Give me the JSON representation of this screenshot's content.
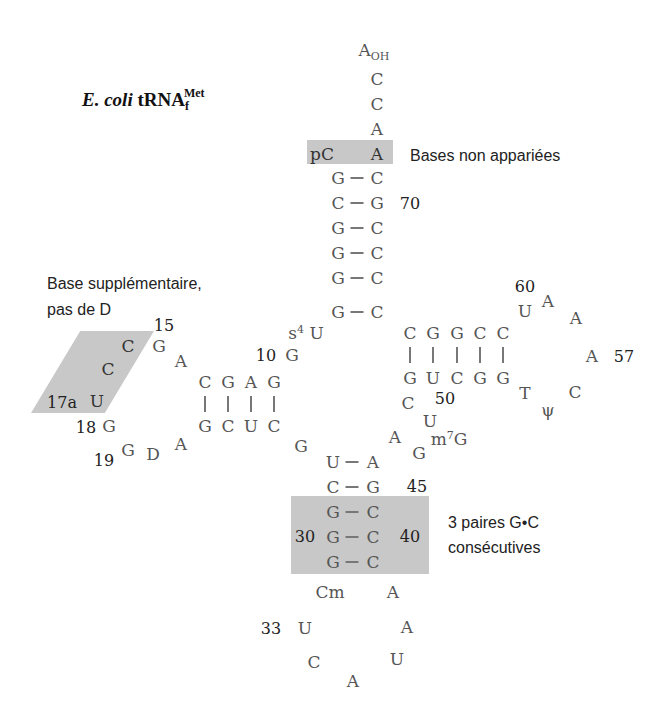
{
  "title": {
    "organism": "E. coli",
    "molecule": "tRNA",
    "subscript": "f",
    "superscript": "Met"
  },
  "annotations": {
    "unpaired": "Bases non appariées",
    "extra_base_line1": "Base supplémentaire,",
    "extra_base_line2": "pas de D",
    "gc_pairs_line1": "3 paires G•C",
    "gc_pairs_line2": "consécutives"
  },
  "acceptor": {
    "tail": [
      "A",
      "C",
      "C",
      "A"
    ],
    "tail_oh": "OH",
    "unpaired_left": "pC",
    "unpaired_right": "A",
    "pairs": [
      [
        "G",
        "C"
      ],
      [
        "C",
        "G"
      ],
      [
        "G",
        "C"
      ],
      [
        "G",
        "C"
      ],
      [
        "G",
        "C"
      ],
      [
        "G",
        "C"
      ]
    ],
    "num_70": "70"
  },
  "d_arm": {
    "s4u_s": "s",
    "s4u_sup": "4",
    "s4u_u": "U",
    "num_10": "10",
    "g10": "G",
    "top": [
      "C",
      "G",
      "A",
      "G"
    ],
    "bottom": [
      "G",
      "C",
      "U",
      "C"
    ],
    "loop": {
      "A14": "A",
      "G15": "G",
      "num_15": "15",
      "C16": "C",
      "C17": "C",
      "U17a": "U",
      "num_17a": "17a",
      "G18": "G",
      "num_18": "18",
      "G19": "G",
      "num_19": "19",
      "D20": "D",
      "A21": "A"
    },
    "g26": "G"
  },
  "t_arm": {
    "top": [
      "C",
      "G",
      "G",
      "C",
      "C"
    ],
    "bottom": [
      "G",
      "U",
      "C",
      "G",
      "G"
    ],
    "loop": {
      "U60": "U",
      "num_60": "60",
      "A59": "A",
      "A58": "A",
      "A57": "A",
      "num_57": "57",
      "C56": "C",
      "psi55": "ψ",
      "T54": "T"
    }
  },
  "variable_loop": {
    "C48": "C",
    "U47": "U",
    "num_50": "50",
    "m7G_m": "m",
    "m7G_sup": "7",
    "m7G_g": "G",
    "G45b": "G",
    "A44": "A"
  },
  "anticodon": {
    "pairs": [
      [
        "U",
        "A"
      ],
      [
        "C",
        "G"
      ],
      [
        "G",
        "C"
      ],
      [
        "G",
        "C"
      ],
      [
        "G",
        "C"
      ]
    ],
    "num_45": "45",
    "num_30": "30",
    "num_40": "40",
    "Cm": "Cm",
    "A38": "A",
    "U33": "U",
    "num_33": "33",
    "C34": "C",
    "A35": "A",
    "U36": "U",
    "A37": "A"
  },
  "colors": {
    "highlight_box": "#c8c8c8",
    "base_text": "#555555",
    "number_text": "#222222"
  }
}
